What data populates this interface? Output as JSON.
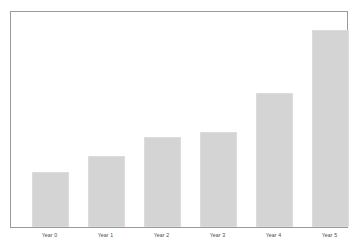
{
  "chart_data": {
    "type": "bar",
    "title": "",
    "subtitle": "",
    "xlabel": "",
    "ylabel": "",
    "categories": [
      "Year 0",
      "Year 1",
      "Year 2",
      "Year 3",
      "Year 4",
      "Year 5"
    ],
    "values": [
      56,
      72,
      91,
      96,
      136,
      200
    ],
    "ylim": [
      0,
      218
    ],
    "grid": false,
    "legend": null,
    "legend_position": "none",
    "axis_tick_labels_y": [],
    "annotations": [],
    "series": [
      {
        "name": "Value",
        "values": [
          56,
          72,
          91,
          96,
          136,
          200
        ]
      }
    ],
    "colors": {
      "bar_fill": "#d4d4d4",
      "bar_border": "#dcdcdc",
      "plot_border": "#9a9a9a",
      "background": "#ffffff",
      "tick_label": "#4a4a4a"
    }
  },
  "figure": {
    "title_text": ""
  }
}
